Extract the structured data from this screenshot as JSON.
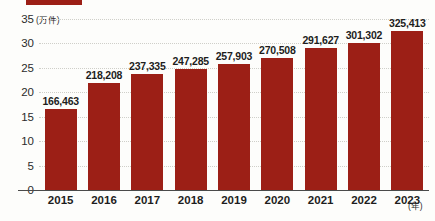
{
  "legend": {
    "series_label": "",
    "swatch_color": "#9c1f16"
  },
  "axes": {
    "y_unit": "(万件)",
    "x_unit": "(年)",
    "y_ticks": [
      "0",
      "5",
      "10",
      "15",
      "20",
      "25",
      "30",
      "35"
    ]
  },
  "chart_data": {
    "type": "bar",
    "title": "",
    "xlabel": "(年)",
    "ylabel": "(万件)",
    "ylim": [
      0,
      35
    ],
    "yticks": [
      0,
      5,
      10,
      15,
      20,
      25,
      30,
      35
    ],
    "grid": true,
    "legend_position": "top-left",
    "bar_color": "#9c1f16",
    "value_unit": "件",
    "axis_unit": "万件",
    "categories": [
      "2015",
      "2016",
      "2017",
      "2018",
      "2019",
      "2020",
      "2021",
      "2022",
      "2023"
    ],
    "values": [
      16.6463,
      21.8208,
      23.7335,
      24.7285,
      25.7903,
      27.0508,
      29.1627,
      30.1302,
      32.5413
    ],
    "data_labels": [
      "166,463",
      "218,208",
      "237,335",
      "247,285",
      "257,903",
      "270,508",
      "291,627",
      "301,302",
      "325,413"
    ],
    "raw_values": [
      166463,
      218208,
      237335,
      247285,
      257903,
      270508,
      291627,
      301302,
      325413
    ]
  }
}
